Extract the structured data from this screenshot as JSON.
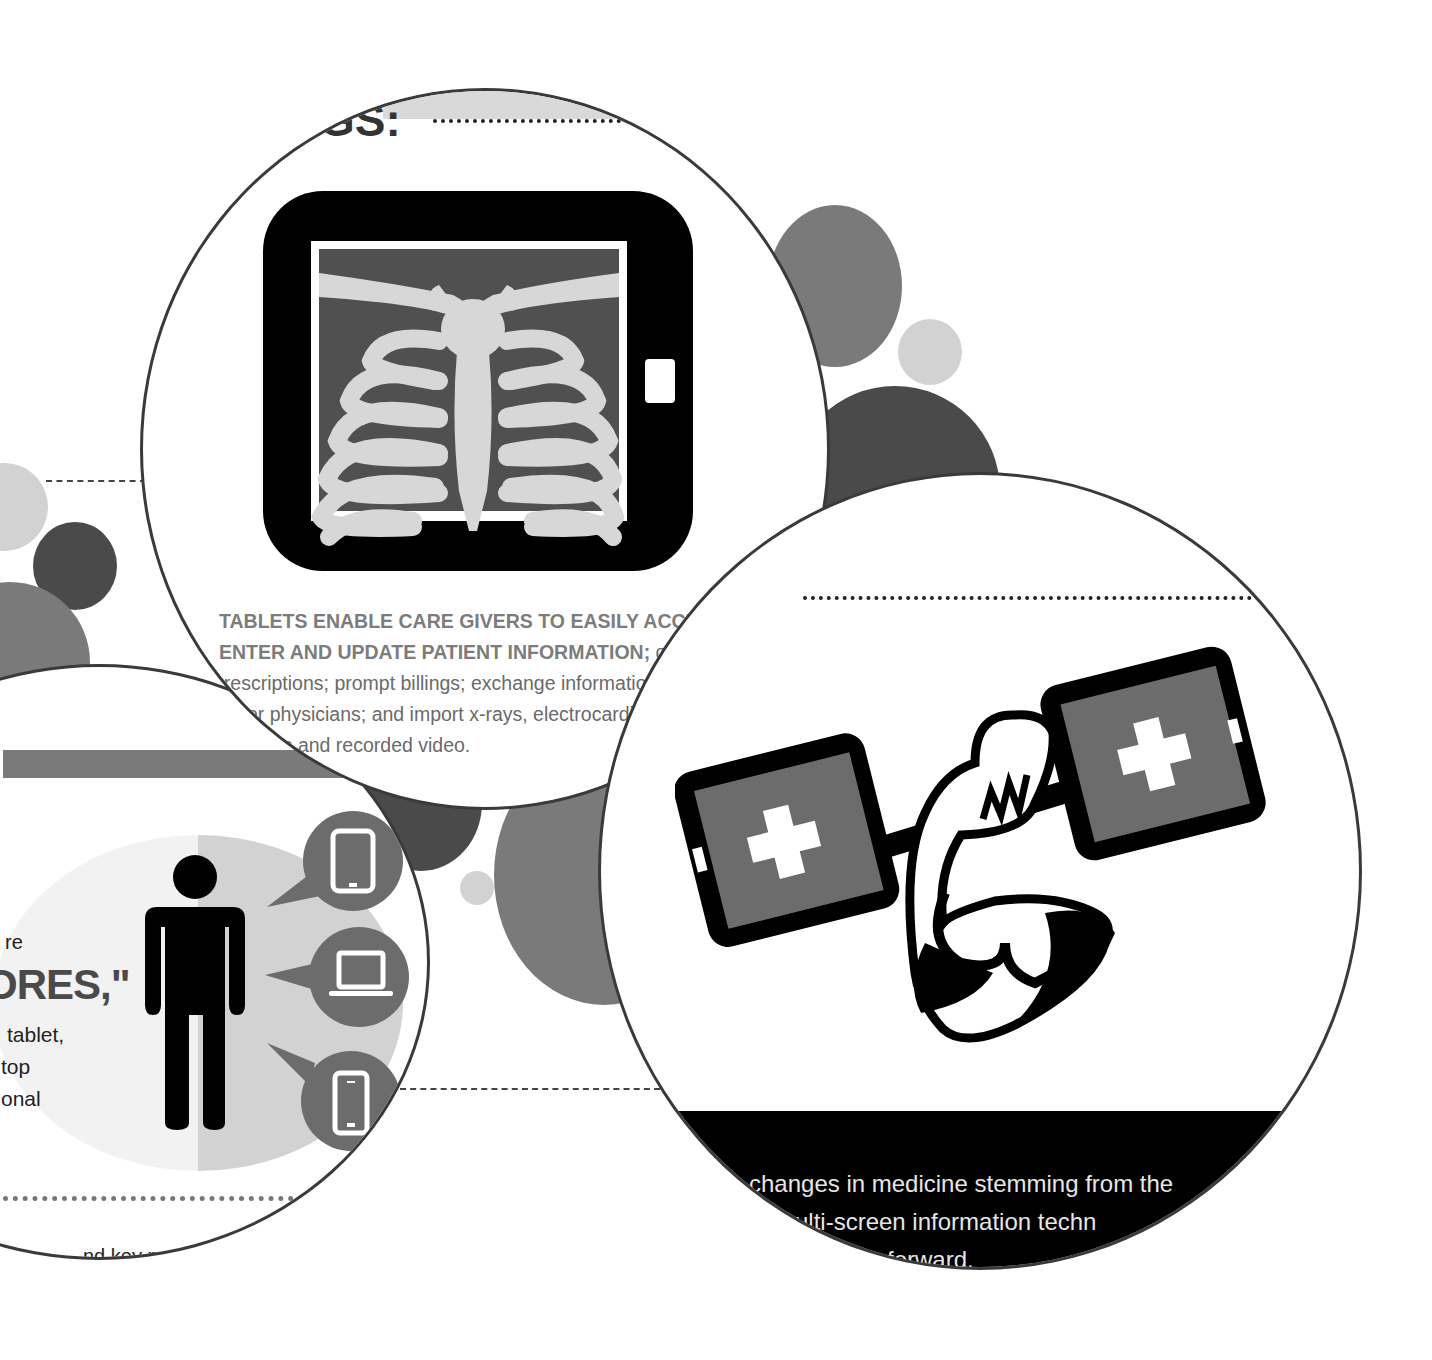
{
  "colors": {
    "bubble_dark": "#4a4a4a",
    "bubble_mid": "#7a7a7a",
    "bubble_light": "#d2d2d2",
    "lens_border": "#3a3a3a",
    "icon_black": "#000000",
    "icon_grey": "#6c6c6c",
    "caption_bold": "#7c7c7c",
    "caption_regular": "#6a6a6a",
    "footer_text": "#e6e6e6"
  },
  "top_lens": {
    "heading_fragment": "GS:",
    "icon": "tablet-xray-icon",
    "caption_bold_line1": "TABLETS ENABLE CARE GIVERS TO EASILY ACCESS,",
    "caption_bold_line2": "ENTER AND UPDATE PATIENT INFORMATION;",
    "caption_line2_tail": " order",
    "caption_line3": "prescriptions; prompt billings; exchange information with",
    "caption_line4": "er physicians; and import x-rays, electrocardiograph",
    "caption_line5": "lts and recorded video."
  },
  "left_lens": {
    "text_line1": "re",
    "text_big": "ORES,\"",
    "text_line3": "tablet,",
    "text_line4": "top",
    "text_line5": "onal",
    "bottom_fragment": "nd key pr",
    "icons": [
      "person-icon",
      "tablet-icon",
      "laptop-icon",
      "smartphone-icon"
    ]
  },
  "right_lens": {
    "icon": "arm-lifting-tablet-dumbbell-icon",
    "footer_line1": "changes in medicine stemming from the",
    "footer_line2": "multi-screen information techn",
    "footer_line3": "forward."
  }
}
